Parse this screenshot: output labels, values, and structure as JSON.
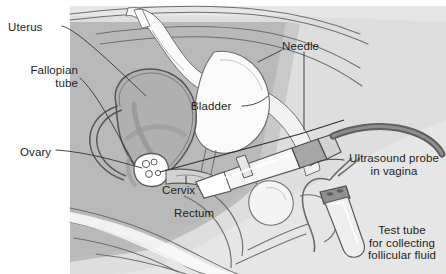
{
  "figure": {
    "background_color": "#ffffff",
    "text_color": "#231f20",
    "body_fill": "#b8b8b8",
    "body_fill_light": "#d5d5d5",
    "body_fill_lighter": "#e4e4e4",
    "organ_fill": "#a0a0a0",
    "bone_fill": "#fbfbfb",
    "outline_color": "#6e6e6e",
    "leader_color": "#3a3a3a"
  },
  "labels": {
    "uterus": "Uterus",
    "fallopian_tube_line1": "Fallopian",
    "fallopian_tube_line2": "tube",
    "needle": "Needle",
    "bladder": "Bladder",
    "ovary": "Ovary",
    "cervix": "Cervix",
    "rectum": "Rectum",
    "ultrasound_probe_line1": "Ultrasound probe",
    "ultrasound_probe_line2": "in vagina",
    "test_tube_line1": "Test tube",
    "test_tube_line2": "for collecting",
    "test_tube_line3": "follicular fluid"
  }
}
